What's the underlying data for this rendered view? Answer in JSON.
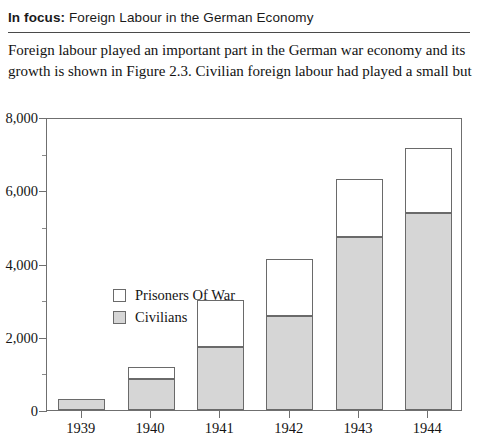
{
  "header": {
    "lead": "In focus:",
    "rest": " Foreign Labour in the German Economy"
  },
  "intro": {
    "line1": "Foreign labour played an important part in the German war economy and its",
    "line2": "growth is shown in Figure 2.3. Civilian foreign labour had played a small but"
  },
  "legend": {
    "pow_label": "Prisoners Of War",
    "civ_label": "Civilians"
  },
  "colors": {
    "civilians": "#d6d6d6",
    "prisoners": "#ffffff",
    "outline": "#6a6a6a",
    "axis": "#6f6f6f"
  },
  "chart_data": {
    "type": "bar",
    "subtype": "stacked",
    "title": "",
    "xlabel": "",
    "ylabel": "",
    "categories": [
      "1939",
      "1940",
      "1941",
      "1942",
      "1943",
      "1944"
    ],
    "series": [
      {
        "name": "Civilians",
        "values": [
          300,
          845,
          1730,
          2570,
          4720,
          5370
        ]
      },
      {
        "name": "Prisoners Of War",
        "values": [
          0,
          325,
          1280,
          1560,
          1580,
          1780
        ]
      }
    ],
    "totals": [
      300,
      1170,
      3010,
      4130,
      6300,
      7150
    ],
    "ylim": [
      0,
      8000
    ],
    "yticks": [
      0,
      2000,
      4000,
      6000,
      8000
    ],
    "ytick_labels": [
      "0",
      "2,000",
      "4,000",
      "6,000",
      "8,000"
    ],
    "yminor_ticks": [
      1000,
      3000,
      5000,
      7000
    ],
    "grid": false,
    "legend_position": "inside-left"
  }
}
